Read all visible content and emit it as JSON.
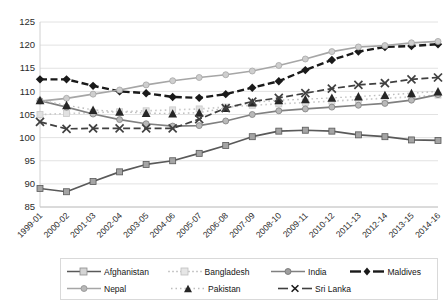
{
  "chart_data": {
    "type": "line",
    "title": "",
    "xlabel": "",
    "ylabel": "",
    "ylim": [
      85,
      125
    ],
    "ytick_step": 5,
    "yticks": [
      "85",
      "90",
      "95",
      "100",
      "105",
      "110",
      "115",
      "120",
      "125"
    ],
    "grid": "horizontal",
    "legend_position": "bottom",
    "categories": [
      "1999-01",
      "2000-02",
      "2001-03",
      "2002-04",
      "2003-05",
      "2004-06",
      "2005-07",
      "2006-08",
      "2007-09",
      "2008-10",
      "2009-11",
      "2010-12",
      "2011-13",
      "2012-14",
      "2013-15",
      "2014-16"
    ],
    "series": [
      {
        "name": "Afghanistan",
        "color": "#595959",
        "marker": "square",
        "dash": "solid",
        "values": [
          89.0,
          88.3,
          90.5,
          92.6,
          94.2,
          95.0,
          96.6,
          98.3,
          100.2,
          101.4,
          101.6,
          101.4,
          100.6,
          100.2,
          99.5,
          99.4
        ]
      },
      {
        "name": "Bangladesh",
        "color": "#c9c9c9",
        "marker": "square",
        "dash": "dotted",
        "values": [
          105.0,
          105.2,
          105.4,
          105.6,
          105.8,
          106.0,
          106.2,
          106.6,
          107.0,
          107.3,
          107.6,
          107.9,
          108.2,
          108.5,
          108.8,
          109.2
        ]
      },
      {
        "name": "India",
        "color": "#808080",
        "marker": "circle",
        "dash": "solid",
        "values": [
          108.0,
          106.6,
          105.1,
          103.9,
          103.0,
          102.5,
          102.6,
          103.6,
          105.0,
          105.8,
          106.2,
          106.6,
          107.0,
          107.4,
          108.1,
          109.3
        ]
      },
      {
        "name": "Maldives",
        "color": "#1a1a1a",
        "marker": "diamond",
        "dash": "dashed",
        "values": [
          112.6,
          112.6,
          111.2,
          110.0,
          109.6,
          108.8,
          108.6,
          109.4,
          110.8,
          112.2,
          114.6,
          116.8,
          118.6,
          119.6,
          119.8,
          120.2
        ]
      },
      {
        "name": "Nepal",
        "color": "#a6a6a6",
        "marker": "circle",
        "dash": "solid",
        "values": [
          107.9,
          108.5,
          109.4,
          110.3,
          111.4,
          112.3,
          113.0,
          113.6,
          114.4,
          115.6,
          117.0,
          118.6,
          119.6,
          119.9,
          120.5,
          120.8
        ]
      },
      {
        "name": "Pakistan",
        "color": "#262626",
        "marker": "triangle",
        "dash": "dotted",
        "values": [
          108.1,
          107.0,
          106.0,
          105.6,
          105.3,
          105.2,
          105.4,
          106.4,
          107.6,
          108.1,
          108.3,
          108.6,
          108.9,
          109.2,
          109.6,
          110.0
        ]
      },
      {
        "name": "Sri Lanka",
        "color": "#404040",
        "marker": "x",
        "dash": "dashed",
        "values": [
          103.4,
          101.9,
          102.0,
          102.0,
          102.0,
          102.0,
          104.0,
          106.4,
          107.8,
          108.6,
          109.6,
          110.6,
          111.4,
          111.8,
          112.6,
          113.0
        ]
      }
    ]
  },
  "legend": {
    "rows": [
      [
        {
          "label": "Afghanistan",
          "key": "line-square-solid-gray"
        },
        {
          "label": "Bangladesh",
          "key": "line-square-dotted-light"
        },
        {
          "label": "India",
          "key": "line-circle-solid-gray"
        },
        {
          "label": "Maldives",
          "key": "line-diamond-dashed-black"
        }
      ],
      [
        {
          "label": "Nepal",
          "key": "line-circle-solid-lightgray"
        },
        {
          "label": "Pakistan",
          "key": "line-triangle-dotted-black"
        },
        {
          "label": "Sri Lanka",
          "key": "line-x-dashed-dark"
        }
      ]
    ]
  }
}
